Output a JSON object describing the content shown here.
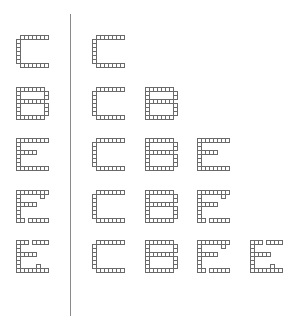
{
  "diagram": {
    "title": "",
    "cell_size_px": 4,
    "divider": {
      "x": 70,
      "top": 14,
      "height": 302
    },
    "glyph_shapes": {
      "C": [
        "01111111",
        "10000000",
        "10000000",
        "10000000",
        "10000000",
        "10000000",
        "10000000",
        "01111111"
      ],
      "B": [
        "11111110",
        "10000001",
        "10000001",
        "11111110",
        "10000001",
        "10000001",
        "10000001",
        "11111110"
      ],
      "E": [
        "11111111",
        "10000000",
        "10000000",
        "11111000",
        "10000000",
        "10000000",
        "10000000",
        "11111111"
      ],
      "E2": [
        "11111111",
        "10000010",
        "10000000",
        "11111000",
        "10000000",
        "10000000",
        "10000000",
        "11011111"
      ],
      "E3": [
        "11101111",
        "10000000",
        "10000000",
        "11111000",
        "10000000",
        "10000000",
        "10000100",
        "11111111"
      ]
    },
    "left_column": [
      {
        "label": "C",
        "shape": "C",
        "x": 16,
        "y": 35
      },
      {
        "label": "B",
        "shape": "B",
        "x": 16,
        "y": 87
      },
      {
        "label": "E",
        "shape": "E",
        "x": 16,
        "y": 138
      },
      {
        "label": "E",
        "shape": "E2",
        "x": 16,
        "y": 190
      },
      {
        "label": "E",
        "shape": "E3",
        "x": 16,
        "y": 240
      }
    ],
    "rows": [
      {
        "sequence": [
          "C"
        ],
        "glyphs": [
          {
            "shape": "C",
            "x": 92,
            "y": 35
          }
        ]
      },
      {
        "sequence": [
          "C",
          "B"
        ],
        "glyphs": [
          {
            "shape": "C",
            "x": 92,
            "y": 87
          },
          {
            "shape": "B",
            "x": 145,
            "y": 87
          }
        ]
      },
      {
        "sequence": [
          "C",
          "B",
          "E"
        ],
        "glyphs": [
          {
            "shape": "C",
            "x": 92,
            "y": 138
          },
          {
            "shape": "B",
            "x": 145,
            "y": 138
          },
          {
            "shape": "E",
            "x": 197,
            "y": 138
          }
        ]
      },
      {
        "sequence": [
          "C",
          "B",
          "E"
        ],
        "glyphs": [
          {
            "shape": "C",
            "x": 92,
            "y": 190
          },
          {
            "shape": "B",
            "x": 145,
            "y": 190
          },
          {
            "shape": "E2",
            "x": 197,
            "y": 190
          }
        ]
      },
      {
        "sequence": [
          "C",
          "B",
          "E",
          "E"
        ],
        "glyphs": [
          {
            "shape": "C",
            "x": 92,
            "y": 240
          },
          {
            "shape": "B",
            "x": 145,
            "y": 240
          },
          {
            "shape": "E2",
            "x": 197,
            "y": 240
          },
          {
            "shape": "E3",
            "x": 250,
            "y": 240
          }
        ]
      }
    ]
  }
}
